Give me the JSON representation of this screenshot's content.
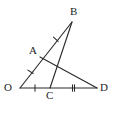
{
  "figure": {
    "kind": "geometry-diagram",
    "width": 114,
    "height": 113,
    "background_color": "#ffffff",
    "stroke_color": "#2b2b2b",
    "label_color": "#1e1e1e"
  },
  "labels": {
    "O": "O",
    "A": "A",
    "B": "B",
    "C": "C",
    "D": "D"
  },
  "points": {
    "O": {
      "x": 20,
      "y": 88
    },
    "A": {
      "x": 40,
      "y": 57
    },
    "B": {
      "x": 72,
      "y": 22
    },
    "C": {
      "x": 50,
      "y": 88
    },
    "D": {
      "x": 97,
      "y": 88
    },
    "X": {
      "x": 57,
      "y": 65
    }
  },
  "label_positions": {
    "O": {
      "x": 4,
      "y": 82
    },
    "A": {
      "x": 29,
      "y": 45
    },
    "B": {
      "x": 70,
      "y": 6
    },
    "C": {
      "x": 46,
      "y": 90
    },
    "D": {
      "x": 100,
      "y": 82
    }
  },
  "segments": [
    {
      "name": "segment-OB",
      "from": "O",
      "to": "B"
    },
    {
      "name": "segment-OD",
      "from": "O",
      "to": "D"
    },
    {
      "name": "segment-AD",
      "from": "A",
      "to": "D"
    },
    {
      "name": "segment-CB",
      "from": "C",
      "to": "B"
    }
  ],
  "tick_marks": [
    {
      "name": "tick-OA",
      "on": "segment-OA",
      "count": 1,
      "x": 30.5,
      "y": 71.8,
      "angle": -57.2
    },
    {
      "name": "tick-AB",
      "on": "segment-AB",
      "count": 1,
      "x": 55.8,
      "y": 39.2,
      "angle": -47.5
    },
    {
      "name": "tick-OC",
      "on": "segment-OC",
      "count": 1,
      "x": 35.0,
      "y": 88.0,
      "angle": 0
    },
    {
      "name": "tick-CD",
      "on": "segment-CD",
      "count": 2,
      "x": 73.5,
      "y": 88.0,
      "angle": 0
    }
  ],
  "tick_geometry": {
    "half_length": 3.2,
    "double_spacing": 2.0
  }
}
